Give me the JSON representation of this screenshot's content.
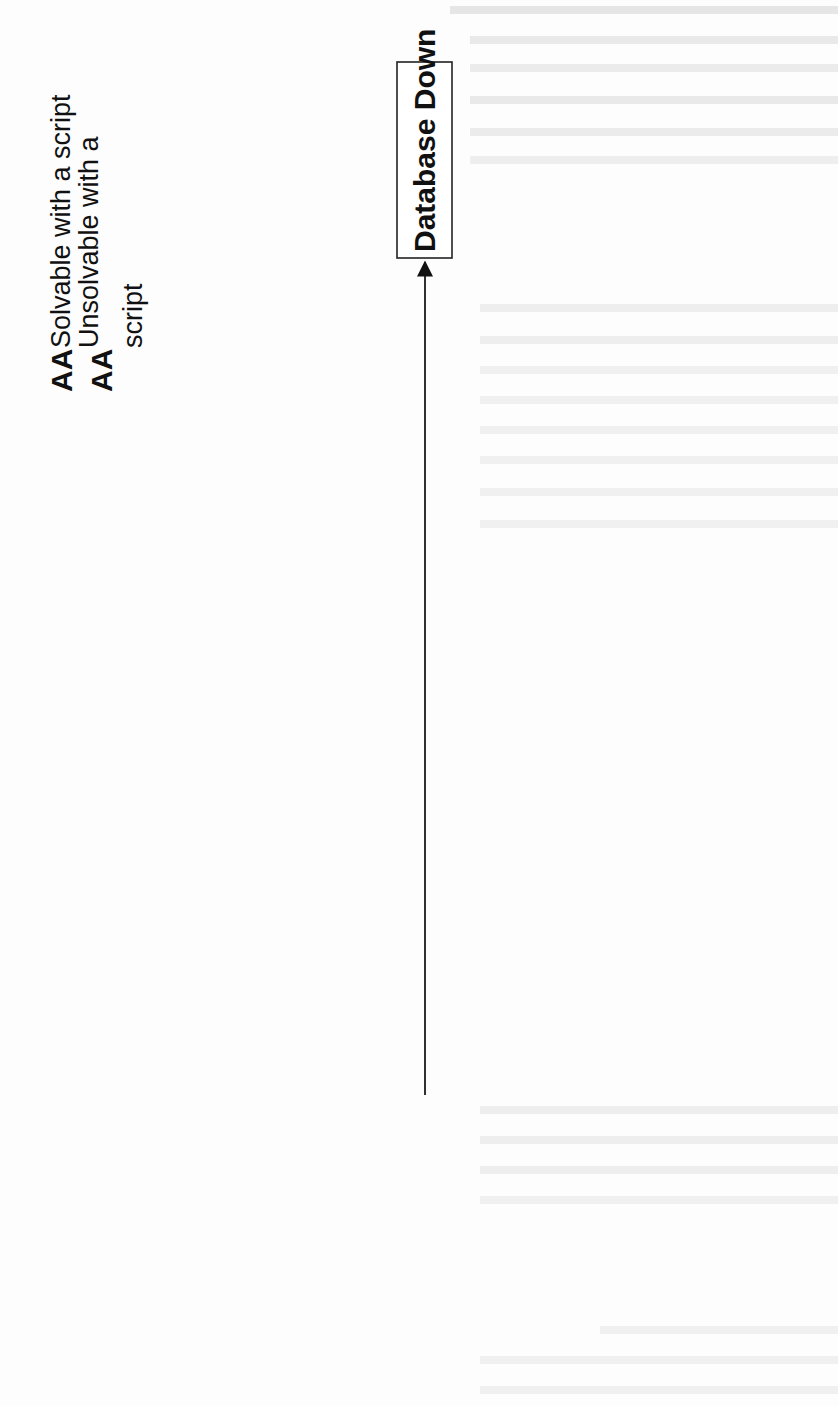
{
  "diagram": {
    "type": "fishbone",
    "orientation": "rotated-90-ccw",
    "effect": {
      "label": "Database Down"
    },
    "legend": [
      {
        "marker": "AA",
        "text": "Solvable with a script"
      },
      {
        "marker": "AA",
        "text": "Unsolvable with a",
        "text_line2": "script"
      }
    ],
    "categories": {
      "memory_overload": {
        "label": "Memory Overload",
        "causes": [
          "Perl Script Hang",
          "Shell Script hang",
          "Rsync hang",
          "HTTP hang",
          "Listener Hang",
          "Oracle Database Problem",
          "Other process hang or use more memory",
          "Ram Read Write Problem"
        ]
      },
      "harddisk": {
        "label": "Harddisk",
        "causes": [
          "Path Oracle full",
          "Can't write log",
          "Can't Create Trace file",
          "Permission deny",
          "Bad sector",
          "Can't run process normal",
          "Can't write log",
          "Read/write fail",
          "Can't access file"
        ]
      },
      "bug": {
        "label": "Bug",
        "causes": [
          "Hang",
          "Crash"
        ]
      },
      "date": {
        "label": "DATE",
        "causes": [
          "Port NTP cannot use",
          "Service NTP not running",
          "Network Problem",
          "Server NTP down"
        ]
      },
      "listener": {
        "label": "Listener",
        "causes": [
          "Network Problem",
          "Firewall Problem",
          "Port 1521 problem",
          "Config",
          "Listener Not running"
        ]
      },
      "table_space": {
        "label": "Table Space",
        "causes": [
          "Table UNDOTBS full",
          "Table SYSTEM full",
          "Table SYSAUX full",
          "Table USERS full"
        ]
      }
    }
  },
  "colors": {
    "ink": "#111111",
    "paper": "#fdfdfd",
    "bleed_through_text": "#d6d6d6"
  }
}
